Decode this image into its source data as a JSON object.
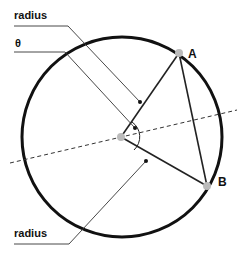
{
  "diagram": {
    "labels": {
      "radius_top": "radius",
      "theta": "θ",
      "radius_bottom": "radius",
      "point_a": "A",
      "point_b": "B"
    },
    "geometry": {
      "circle": {
        "cx": 122,
        "cy": 137,
        "r": 100
      },
      "center": {
        "x": 121,
        "y": 137
      },
      "point_a": {
        "x": 179,
        "y": 53
      },
      "point_b": {
        "x": 207,
        "y": 186
      },
      "dashed_axis": {
        "x1": 10,
        "y1": 163,
        "x2": 237,
        "y2": 110
      }
    },
    "colors": {
      "stroke": "#111111",
      "point_fill": "#bbbbbb",
      "leader": "#333333"
    }
  }
}
